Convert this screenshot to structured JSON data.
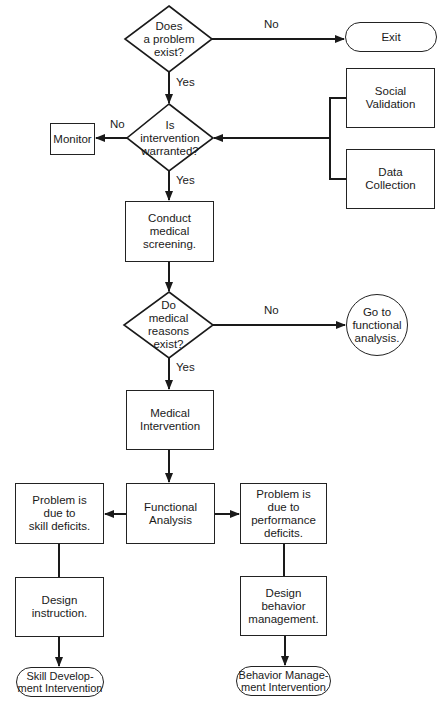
{
  "nodes": {
    "problem_exist": "Does\na problem\nexist?",
    "exit": "Exit",
    "social_validation": "Social\nValidation",
    "data_collection": "Data\nCollection",
    "monitor": "Monitor",
    "intervention_warranted": "Is\nintervention\nwarranted?",
    "conduct_screening": "Conduct\nmedical\nscreening.",
    "medical_reasons": "Do\nmedical\nreasons\nexist?",
    "go_functional": "Go to\nfunctional\nanalysis.",
    "medical_intervention": "Medical\nIntervention",
    "functional_analysis": "Functional\nAnalysis",
    "skill_deficits": "Problem is\ndue to\nskill deficits.",
    "performance_deficits": "Problem is\ndue to\nperformance\ndeficits.",
    "design_instruction": "Design\ninstruction.",
    "design_behavior": "Design\nbehavior\nmanagement.",
    "skill_dev_intervention": "Skill Develop-\nment Intervention",
    "behavior_mgmt_intervention": "Behavior Manage-\nment Intervention"
  },
  "labels": {
    "no1": "No",
    "yes1": "Yes",
    "no2": "No",
    "yes2": "Yes",
    "no3": "No",
    "yes3": "Yes"
  },
  "colors": {
    "line": "#1a1a1a",
    "background": "#ffffff"
  }
}
